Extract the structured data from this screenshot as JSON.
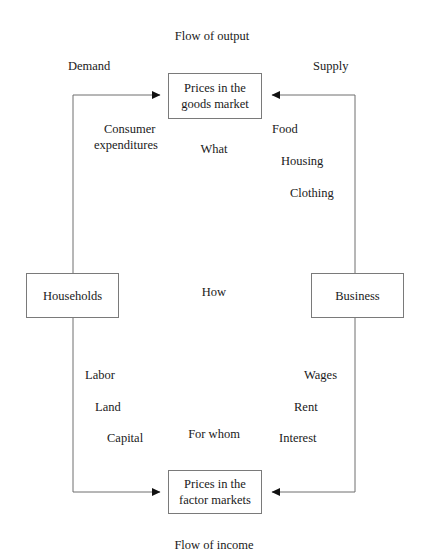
{
  "diagram": {
    "title_top": "Flow of output",
    "title_bottom": "Flow of income",
    "side_labels": {
      "left": "Demand",
      "right": "Supply"
    },
    "nodes": {
      "goods_market": {
        "line1": "Prices in the",
        "line2": "goods market"
      },
      "factor_markets": {
        "line1": "Prices in the",
        "line2": "factor markets"
      },
      "households": "Households",
      "business": "Business"
    },
    "upper_left_labels": [
      "Consumer",
      "expenditures"
    ],
    "upper_right_labels": [
      "Food",
      "Housing",
      "Clothing"
    ],
    "lower_left_labels": [
      "Labor",
      "Land",
      "Capital"
    ],
    "lower_right_labels": [
      "Wages",
      "Rent",
      "Interest"
    ],
    "center_questions": [
      "What",
      "How",
      "For whom"
    ],
    "colors": {
      "background": "#ffffff",
      "line": "#6f6f6f",
      "box_border": "#7a7a7a",
      "text": "#1a1a1a",
      "arrow": "#111111"
    }
  }
}
